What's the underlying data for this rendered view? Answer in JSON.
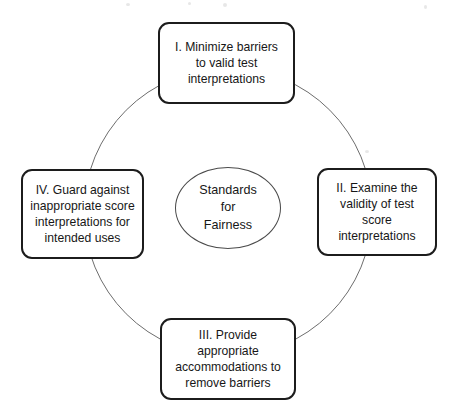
{
  "figure": {
    "type": "cycle-diagram",
    "center": {
      "label": "Standards\nfor\nFairness"
    },
    "nodes": [
      {
        "id": "node-top",
        "position": "top",
        "numeral": "I.",
        "label": "I. Minimize barriers\nto valid test\ninterpretations"
      },
      {
        "id": "node-right",
        "position": "right",
        "numeral": "II.",
        "label": "II. Examine the\nvalidity of test score\ninterpretations"
      },
      {
        "id": "node-bottom",
        "position": "bottom",
        "numeral": "III.",
        "label": "III. Provide\nappropriate\naccommodations to\nremove barriers"
      },
      {
        "id": "node-left",
        "position": "left",
        "numeral": "IV.",
        "label": "IV. Guard against\ninappropriate score\ninterpretations for\nintended uses"
      }
    ],
    "connector": {
      "shape": "circle",
      "stroke_color": "#6d6d6d",
      "stroke_width": "1"
    },
    "colors": {
      "background": "#ffffff",
      "box_border": "#1c1c1c",
      "ellipse_border": "#4a4a4a",
      "text": "#171717"
    }
  }
}
